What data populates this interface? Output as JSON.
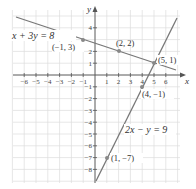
{
  "chart_data": {
    "type": "line",
    "title": "",
    "xlabel": "x",
    "ylabel": "y",
    "xlim": [
      -7,
      7
    ],
    "ylim": [
      -9,
      5
    ],
    "grid": true,
    "x_ticks": [
      -6,
      -5,
      -4,
      -3,
      -2,
      -1,
      1,
      2,
      3,
      4,
      5,
      6
    ],
    "y_ticks": [
      -8,
      -7,
      -6,
      -5,
      -4,
      -3,
      -2,
      -1,
      1,
      2,
      4
    ],
    "series": [
      {
        "name": "x + 3y = 8",
        "equation": "x + 3y = 8",
        "points": [
          {
            "x": -1,
            "y": 3,
            "label": "(−1, 3)"
          },
          {
            "x": 2,
            "y": 2,
            "label": "(2, 2)"
          },
          {
            "x": 5,
            "y": 1,
            "label": "(5, 1)"
          }
        ]
      },
      {
        "name": "2x − y = 9",
        "equation": "2x − y = 9",
        "points": [
          {
            "x": 1,
            "y": -7,
            "label": "(1, −7)"
          },
          {
            "x": 4,
            "y": -1,
            "label": "(4, −1)"
          },
          {
            "x": 5,
            "y": 1,
            "label": "(5, 1)"
          }
        ]
      }
    ],
    "intersection": {
      "x": 5,
      "y": 1,
      "label": "(5, 1)"
    }
  },
  "labels": {
    "x_axis": "x",
    "y_axis": "y",
    "eq1": "x + 3y = 8",
    "eq2": "2x − y = 9",
    "p_m1_3": "(−1, 3)",
    "p_2_2": "(2, 2)",
    "p_5_1": "(5, 1)",
    "p_4_m1": "(4, −1)",
    "p_1_m7": "(1, −7)"
  },
  "ticks": {
    "x": [
      "−6",
      "−5",
      "−4",
      "−3",
      "−2",
      "−1",
      "1",
      "2",
      "3",
      "4",
      "5",
      "6"
    ],
    "y": [
      "−8",
      "−7",
      "−6",
      "−5",
      "−4",
      "−3",
      "−2",
      "−1",
      "1",
      "2",
      "4"
    ]
  },
  "colors": {
    "line": "#777777",
    "grid": "#dddddd",
    "axis": "#555555",
    "point": "#888888"
  }
}
